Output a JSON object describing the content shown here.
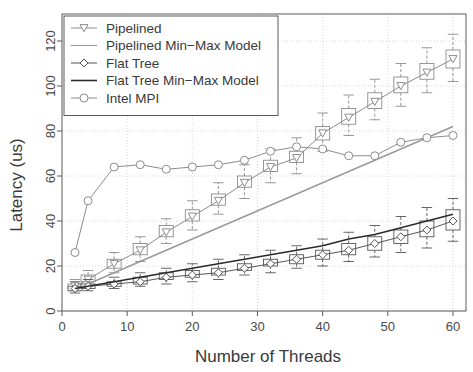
{
  "chart_data": {
    "type": "line",
    "title": "",
    "xlabel": "Number of Threads",
    "ylabel": "Latency (us)",
    "xlim": [
      0,
      62
    ],
    "ylim": [
      0,
      132
    ],
    "xticks": [
      0,
      10,
      20,
      30,
      40,
      50,
      60
    ],
    "yticks": [
      0,
      20,
      40,
      60,
      80,
      100,
      120
    ],
    "grid": true,
    "legend_position": "top-left",
    "x": [
      2,
      4,
      8,
      12,
      16,
      20,
      24,
      28,
      32,
      36,
      40,
      44,
      48,
      52,
      56,
      60
    ],
    "series": [
      {
        "name": "Pipelined",
        "marker": "triangle-down",
        "style": "boxplot-with-line",
        "color": "#8c8c8c",
        "values": [
          11,
          14,
          21,
          27,
          35,
          42,
          49,
          57,
          64,
          68,
          79,
          86,
          93,
          100,
          106,
          112
        ],
        "box_low": [
          10,
          13,
          19,
          25,
          33,
          40,
          47,
          55,
          62,
          66,
          76,
          83,
          90,
          97,
          103,
          108
        ],
        "box_high": [
          12,
          16,
          23,
          30,
          38,
          45,
          52,
          60,
          67,
          71,
          82,
          90,
          97,
          104,
          110,
          116
        ],
        "whisker_low": [
          9,
          11,
          17,
          22,
          30,
          36,
          43,
          50,
          57,
          61,
          71,
          78,
          85,
          91,
          97,
          102
        ],
        "whisker_high": [
          14,
          18,
          26,
          33,
          41,
          49,
          57,
          65,
          72,
          77,
          88,
          96,
          103,
          110,
          117,
          123
        ]
      },
      {
        "name": "Pipelined Min-Max Model",
        "marker": "none",
        "style": "line",
        "color": "#9a9a9a",
        "values": [
          10,
          12,
          17,
          22,
          27,
          32,
          37,
          42,
          47,
          52,
          57,
          62,
          67,
          72,
          77,
          82
        ]
      },
      {
        "name": "Flat Tree",
        "marker": "diamond",
        "style": "boxplot-with-line",
        "color": "#555555",
        "values": [
          10,
          11,
          12,
          13,
          15,
          16,
          17,
          19,
          21,
          23,
          25,
          27,
          30,
          33,
          36,
          40
        ],
        "box_low": [
          9,
          10,
          11,
          12,
          14,
          15,
          16,
          18,
          20,
          21,
          23,
          25,
          27,
          30,
          33,
          36
        ],
        "box_high": [
          11,
          12,
          13,
          15,
          17,
          18,
          19,
          21,
          23,
          25,
          27,
          30,
          33,
          36,
          40,
          45
        ],
        "whisker_low": [
          8,
          9,
          10,
          11,
          12,
          13,
          14,
          16,
          17,
          19,
          20,
          22,
          24,
          26,
          28,
          31
        ],
        "whisker_high": [
          13,
          14,
          15,
          17,
          19,
          21,
          23,
          25,
          27,
          29,
          32,
          35,
          38,
          42,
          46,
          50
        ]
      },
      {
        "name": "Flat Tree Min-Max Model",
        "marker": "none",
        "style": "line",
        "color": "#2b2b2b",
        "values": [
          10,
          11,
          13,
          15,
          17,
          19,
          21,
          23,
          25,
          27,
          29,
          32,
          34,
          37,
          40,
          43
        ]
      },
      {
        "name": "Intel MPI",
        "marker": "circle",
        "style": "line-marker",
        "color": "#8c8c8c",
        "values": [
          26,
          49,
          64,
          65,
          63,
          64,
          65,
          67,
          71,
          73,
          72,
          69,
          69,
          75,
          77,
          78
        ]
      }
    ]
  },
  "legend": {
    "items": [
      {
        "label": "Pipelined",
        "marker": "triangle-down",
        "color": "#8c8c8c"
      },
      {
        "label": "Pipelined Min−Max Model",
        "marker": "line-light",
        "color": "#9a9a9a"
      },
      {
        "label": "Flat Tree",
        "marker": "diamond",
        "color": "#555555"
      },
      {
        "label": "Flat Tree Min−Max Model",
        "marker": "line-dark",
        "color": "#2b2b2b"
      },
      {
        "label": "Intel MPI",
        "marker": "circle",
        "color": "#8c8c8c"
      }
    ]
  },
  "axes": {
    "x_title": "Number of Threads",
    "y_title": "Latency (us)",
    "x_tick_labels": [
      "0",
      "10",
      "20",
      "30",
      "40",
      "50",
      "60"
    ],
    "y_tick_labels": [
      "0",
      "20",
      "40",
      "60",
      "80",
      "100",
      "120"
    ]
  }
}
